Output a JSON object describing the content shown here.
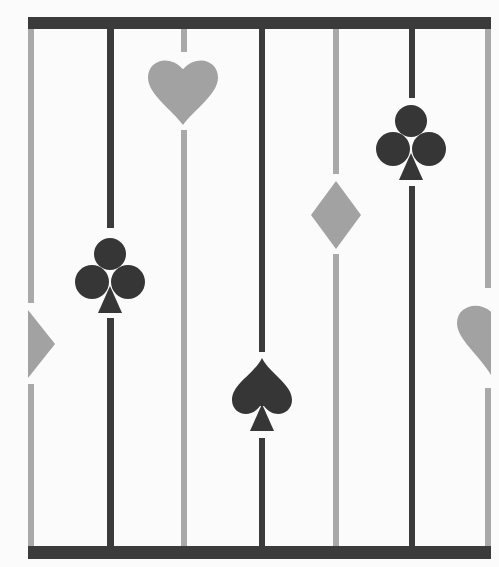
{
  "canvas": {
    "width": 499,
    "height": 567,
    "background": "#fbfbfb"
  },
  "colors": {
    "dark": "#3b3b3b",
    "light": "#a9a9a9",
    "suit_light": "#a2a2a2",
    "suit_dark": "#363636"
  },
  "frame": {
    "top_bar": {
      "x": 28,
      "y": 17,
      "w": 463,
      "h": 12
    },
    "bottom_bar": {
      "x": 28,
      "y": 546,
      "w": 463,
      "h": 13
    }
  },
  "lines": [
    {
      "x": 28,
      "w": 6,
      "tone": "light",
      "gaps": [
        [
          303,
          384
        ]
      ]
    },
    {
      "x": 107,
      "w": 7,
      "tone": "dark",
      "gaps": [
        [
          228,
          318
        ]
      ]
    },
    {
      "x": 181,
      "w": 6,
      "tone": "light",
      "gaps": [
        [
          52,
          130
        ]
      ]
    },
    {
      "x": 259,
      "w": 6,
      "tone": "dark",
      "gaps": [
        [
          352,
          438
        ]
      ]
    },
    {
      "x": 333,
      "w": 6,
      "tone": "light",
      "gaps": [
        [
          174,
          254
        ]
      ]
    },
    {
      "x": 409,
      "w": 6,
      "tone": "dark",
      "gaps": [
        [
          98,
          186
        ]
      ]
    },
    {
      "x": 485,
      "w": 6,
      "tone": "light",
      "gaps": [
        [
          288,
          388
        ]
      ]
    }
  ],
  "suits": [
    {
      "type": "heart",
      "cx": 183,
      "top": 57,
      "w": 70,
      "h": 68,
      "tone": "suit_light"
    },
    {
      "type": "club",
      "cx": 110,
      "top": 238,
      "tone": "suit_dark"
    },
    {
      "type": "half-diamond",
      "x": 28,
      "top": 310,
      "w": 27,
      "h": 68,
      "tone": "suit_light"
    },
    {
      "type": "spade",
      "cx": 262,
      "top": 358,
      "tone": "suit_dark"
    },
    {
      "type": "diamond",
      "cx": 336,
      "top": 181,
      "w": 50,
      "h": 68,
      "tone": "suit_light"
    },
    {
      "type": "club",
      "cx": 411,
      "top": 105,
      "tone": "suit_dark"
    },
    {
      "type": "half-heart",
      "right": 491,
      "top": 303,
      "w": 34,
      "h": 72,
      "tone": "suit_light"
    }
  ]
}
